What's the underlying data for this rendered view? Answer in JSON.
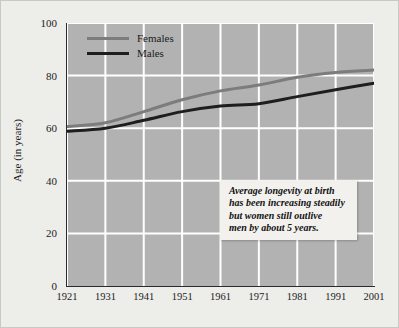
{
  "chart_data": {
    "type": "line",
    "title": "",
    "xlabel": "",
    "ylabel": "Age (in years)",
    "categories": [
      "1921",
      "1931",
      "1941",
      "1951",
      "1961",
      "1971",
      "1981",
      "1991",
      "2001"
    ],
    "x": [
      1921,
      1931,
      1941,
      1951,
      1961,
      1971,
      1981,
      1991,
      2001
    ],
    "series": [
      {
        "name": "Females",
        "color": "#7c7c7c",
        "values": [
          60.6,
          62.1,
          66.3,
          70.8,
          74.2,
          76.4,
          79.4,
          81.2,
          82.1
        ]
      },
      {
        "name": "Males",
        "color": "#1e1e1e",
        "values": [
          58.8,
          60.0,
          63.0,
          66.3,
          68.4,
          69.3,
          72.0,
          74.6,
          77.1
        ]
      }
    ],
    "ylim": [
      0,
      100
    ],
    "yticks": [
      0,
      20,
      40,
      60,
      80,
      100
    ],
    "ytick_labels": [
      "0",
      "20",
      "40",
      "60",
      "80",
      "100"
    ],
    "grid": true,
    "grid_color": "#ffffff",
    "plot_background": "#b2b2b2",
    "legend_position": "top-left",
    "annotations": [
      {
        "text": "Average longevity at birth has been increasing steadily but women still outlive men by about 5 years.",
        "lines": [
          "Average longevity at birth",
          "has been increasing steadily",
          "but women still outlive",
          "men by about 5 years."
        ]
      }
    ]
  },
  "legend": {
    "items": [
      {
        "label": "Females"
      },
      {
        "label": "Males"
      }
    ]
  },
  "axes": {
    "y_title": "Age (in years)"
  }
}
